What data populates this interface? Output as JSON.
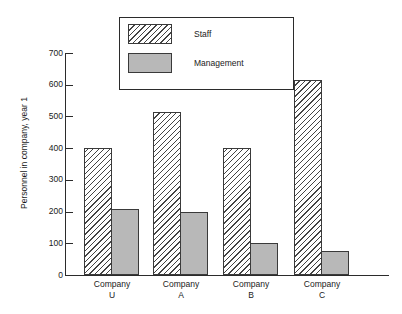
{
  "chart_data": {
    "type": "bar",
    "title": "",
    "xlabel": "",
    "ylabel": "Personnel in company, year 1",
    "categories": [
      "Company U",
      "Company A",
      "Company B",
      "Company C"
    ],
    "category_lines": [
      [
        "Company",
        "U"
      ],
      [
        "Company",
        "A"
      ],
      [
        "Company",
        "B"
      ],
      [
        "Company",
        "C"
      ]
    ],
    "series": [
      {
        "name": "Staff",
        "values": [
          400,
          515,
          400,
          615
        ],
        "fill": "diagonal-hatch",
        "color": "#ffffff"
      },
      {
        "name": "Management",
        "values": [
          208,
          200,
          100,
          75
        ],
        "fill": "solid",
        "color": "#b8b8b8"
      }
    ],
    "ylim": [
      0,
      700
    ],
    "y_ticks": [
      0,
      100,
      200,
      300,
      400,
      500,
      600,
      700
    ],
    "y_tick_labels": [
      "0",
      "100",
      "200",
      "300",
      "400",
      "500",
      "600",
      "700"
    ],
    "grid": false,
    "legend_position": "top-center",
    "legend_entries": [
      "Staff",
      "Management"
    ]
  },
  "axes": {
    "y_title": "Personnel in company, year 1"
  },
  "legend": {
    "staff_label": "Staff",
    "management_label": "Management"
  }
}
